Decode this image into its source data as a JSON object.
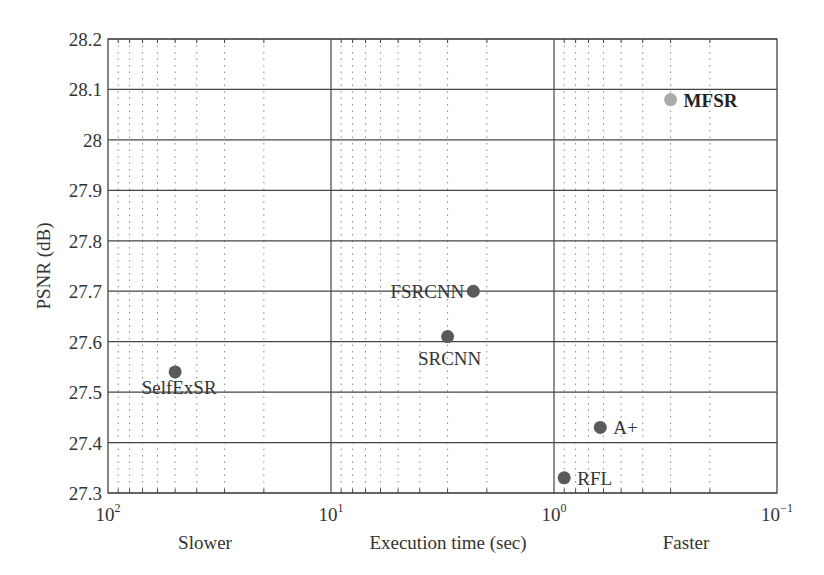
{
  "chart_data": {
    "type": "scatter",
    "title": "",
    "xlabel": "Execution time (sec)",
    "ylabel": "PSNR (dB)",
    "x_scale": "log",
    "x_reversed": true,
    "xlim": [
      100,
      0.1
    ],
    "ylim": [
      27.3,
      28.2
    ],
    "grid": true,
    "x_side_labels": {
      "left": "Slower",
      "right": "Faster"
    },
    "x_ticks": [
      {
        "value": 100,
        "base": "10",
        "exp": "2"
      },
      {
        "value": 10,
        "base": "10",
        "exp": "1"
      },
      {
        "value": 1,
        "base": "10",
        "exp": "0"
      },
      {
        "value": 0.1,
        "base": "10",
        "exp": "−1"
      }
    ],
    "y_ticks": [
      "27.3",
      "27.4",
      "27.5",
      "27.6",
      "27.7",
      "27.8",
      "27.9",
      "28",
      "28.1",
      "28.2"
    ],
    "points": [
      {
        "name": "SelfExSR",
        "time_sec": 50,
        "psnr": 27.54,
        "color": "#5a5a5a",
        "label_pos": "below-left",
        "bold": false
      },
      {
        "name": "SRCNN",
        "time_sec": 3.0,
        "psnr": 27.61,
        "color": "#5a5a5a",
        "label_pos": "below",
        "bold": false
      },
      {
        "name": "FSRCNN",
        "time_sec": 2.3,
        "psnr": 27.7,
        "color": "#5a5a5a",
        "label_pos": "left",
        "bold": false
      },
      {
        "name": "A+",
        "time_sec": 0.62,
        "psnr": 27.43,
        "color": "#5a5a5a",
        "label_pos": "right",
        "bold": false
      },
      {
        "name": "RFL",
        "time_sec": 0.9,
        "psnr": 27.33,
        "color": "#5a5a5a",
        "label_pos": "right",
        "bold": false
      },
      {
        "name": "MFSR",
        "time_sec": 0.3,
        "psnr": 28.08,
        "color": "#ababab",
        "label_pos": "right",
        "bold": true
      }
    ]
  }
}
